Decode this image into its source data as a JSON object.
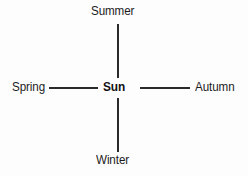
{
  "diagram": {
    "center": {
      "label": "Sun",
      "color": "#111111"
    },
    "nodes": [
      {
        "id": "summer",
        "label": "Summer",
        "direction": "north"
      },
      {
        "id": "autumn",
        "label": "Autumn",
        "direction": "east"
      },
      {
        "id": "winter",
        "label": "Winter",
        "direction": "south"
      },
      {
        "id": "spring",
        "label": "Spring",
        "direction": "west"
      }
    ],
    "connectors": [
      {
        "id": "north",
        "orientation": "vertical"
      },
      {
        "id": "south",
        "orientation": "vertical"
      },
      {
        "id": "west",
        "orientation": "horizontal"
      },
      {
        "id": "east",
        "orientation": "horizontal"
      }
    ],
    "colors": {
      "background": "#fdfdfd",
      "line": "#2a2a2a",
      "text": "#1b1b1b"
    }
  }
}
